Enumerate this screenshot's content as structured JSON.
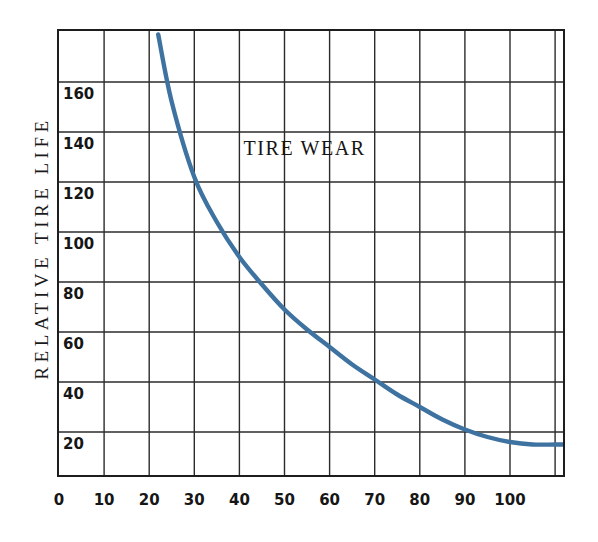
{
  "chart_data": {
    "type": "line",
    "title": "TIRE WEAR",
    "xlabel": "",
    "ylabel": "RELATIVE TIRE LIFE",
    "xlim": [
      0,
      113
    ],
    "ylim": [
      0,
      179
    ],
    "grid": true,
    "legend": null,
    "x_ticks": [
      "0",
      "10",
      "20",
      "30",
      "40",
      "50",
      "60",
      "70",
      "80",
      "90",
      "100"
    ],
    "x_tick_values": [
      0,
      10,
      20,
      30,
      40,
      50,
      60,
      70,
      80,
      90,
      100
    ],
    "y_ticks": [
      "20",
      "40",
      "60",
      "80",
      "100",
      "120",
      "140",
      "160"
    ],
    "y_tick_values": [
      20,
      40,
      60,
      80,
      100,
      120,
      140,
      160
    ],
    "series": [
      {
        "name": "Relative tire life",
        "color": "#3E72A0",
        "x": [
          22,
          25,
          30,
          35,
          40,
          45,
          50,
          55,
          60,
          65,
          70,
          75,
          80,
          85,
          90,
          95,
          100,
          105,
          110,
          113
        ],
        "values": [
          179,
          152,
          122,
          104,
          90,
          79,
          69,
          61,
          54,
          47,
          41,
          35,
          30,
          25,
          21,
          18,
          16,
          15,
          15,
          15
        ]
      }
    ]
  },
  "figure": {
    "background_color": "#ffffff",
    "frame_color": "#1d1d1d",
    "grid_color": "#2b2b2b",
    "curve_color": "#3E72A0"
  }
}
